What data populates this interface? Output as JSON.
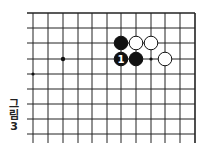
{
  "caption": {
    "line1": "그",
    "line2": "림",
    "line3": "3"
  },
  "board": {
    "x_lines": [
      33,
      48,
      63,
      78,
      92,
      107,
      121,
      136,
      151,
      165,
      180,
      195
    ],
    "y_lines": [
      13,
      28,
      43,
      59,
      74,
      89,
      104,
      119,
      134
    ],
    "line_color": "#222222",
    "star_points": [
      {
        "x": 63,
        "y": 59
      }
    ],
    "markers": [
      {
        "x": 33,
        "y": 74
      },
      {
        "x": 151,
        "y": 59
      }
    ],
    "stones": [
      {
        "color": "black",
        "x": 121,
        "y": 43,
        "label": ""
      },
      {
        "color": "white",
        "x": 136,
        "y": 43,
        "label": ""
      },
      {
        "color": "white",
        "x": 151,
        "y": 43,
        "label": ""
      },
      {
        "color": "black",
        "x": 121,
        "y": 59,
        "label": "1"
      },
      {
        "color": "black",
        "x": 136,
        "y": 59,
        "label": ""
      },
      {
        "color": "white",
        "x": 165,
        "y": 59,
        "label": ""
      }
    ]
  }
}
